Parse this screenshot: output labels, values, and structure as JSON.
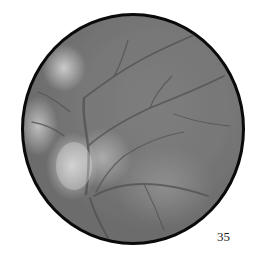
{
  "image": {
    "type": "fundus-photograph",
    "colors": {
      "background": "#ffffff",
      "border": "#0a0a0a",
      "retina_base": "#787878",
      "optic_disc_highlight": "#e0e0e0",
      "vessels": "#4a4a4a"
    }
  },
  "caption": {
    "label": "35"
  }
}
